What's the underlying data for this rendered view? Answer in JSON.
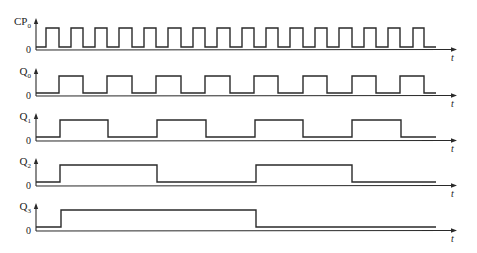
{
  "diagram": {
    "time_axis_label": "t",
    "zero_label": "0",
    "x_start": 36,
    "wave_end": 436,
    "axis_end": 457,
    "signals": [
      {
        "name": "CP",
        "subscript": "0",
        "axis_top": 18,
        "high_y": 28,
        "low_y": 47,
        "baseline_y": 50,
        "initial": 0,
        "edges": [
          46,
          59,
          71,
          83,
          95,
          107,
          119,
          132,
          144,
          156,
          168,
          181,
          193,
          205,
          217,
          230,
          242,
          254,
          266,
          278,
          290,
          303,
          315,
          327,
          339,
          352,
          364,
          376,
          388,
          400,
          413,
          424
        ]
      },
      {
        "name": "Q",
        "subscript": "0",
        "axis_top": 68,
        "high_y": 76,
        "low_y": 93,
        "baseline_y": 96,
        "initial": 0,
        "edges": [
          59,
          83,
          107,
          132,
          156,
          181,
          205,
          230,
          254,
          278,
          303,
          327,
          352,
          376,
          400,
          424
        ]
      },
      {
        "name": "Q",
        "subscript": "1",
        "axis_top": 113,
        "high_y": 120,
        "low_y": 137,
        "baseline_y": 141,
        "initial": 0,
        "edges": [
          60,
          108,
          157,
          206,
          255,
          303,
          352,
          401
        ]
      },
      {
        "name": "Q",
        "subscript": "2",
        "axis_top": 158,
        "high_y": 165,
        "low_y": 182,
        "baseline_y": 186,
        "initial": 0,
        "edges": [
          60,
          157,
          256,
          352
        ]
      },
      {
        "name": "Q",
        "subscript": "3",
        "axis_top": 203,
        "high_y": 210,
        "low_y": 227,
        "baseline_y": 231,
        "initial": 0,
        "edges": [
          61,
          256
        ]
      }
    ],
    "colors": {
      "line": "#2a2a2a",
      "background": "#ffffff"
    }
  }
}
